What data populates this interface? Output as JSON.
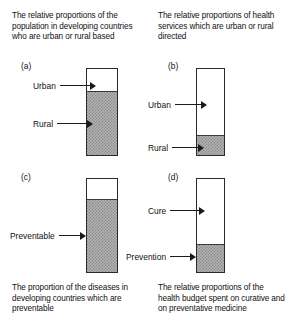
{
  "figure": {
    "panels": [
      {
        "letter": "(a)",
        "caption": "The relative proportions of the population in developing countries who are urban or rural based",
        "caption_position": "above",
        "segments": [
          {
            "label": "Urban",
            "fill": "white",
            "fraction": 0.27
          },
          {
            "label": "Rural",
            "fill": "hatched",
            "fraction": 0.73
          }
        ]
      },
      {
        "letter": "(b)",
        "caption": "The relative proportions of health services which are urban or rural directed",
        "caption_position": "above",
        "segments": [
          {
            "label": "Urban",
            "fill": "white",
            "fraction": 0.78
          },
          {
            "label": "Rural",
            "fill": "hatched",
            "fraction": 0.22
          }
        ]
      },
      {
        "letter": "(c)",
        "caption": "The proportion of the diseases in developing countries which are preventable",
        "caption_position": "below",
        "segments": [
          {
            "label": "",
            "fill": "white",
            "fraction": 0.23
          },
          {
            "label": "Preventable",
            "fill": "hatched",
            "fraction": 0.77
          }
        ]
      },
      {
        "letter": "(d)",
        "caption": "The relative proportions of the health budget spent  on curative and on preventative medicine",
        "caption_position": "below",
        "segments": [
          {
            "label": "Cure",
            "fill": "white",
            "fraction": 0.71
          },
          {
            "label": "Prevention",
            "fill": "hatched",
            "fraction": 0.29
          }
        ]
      }
    ],
    "colors": {
      "outline": "#2a2a2a",
      "hatch_light": "#b3b3b3",
      "hatch_dark": "#8a8a8a",
      "white_fill": "#ffffff",
      "text": "#111111"
    }
  },
  "chart_data": {
    "type": "bar",
    "title": "",
    "charts": [
      {
        "id": "a",
        "title": "The relative proportions of the population in developing countries who are urban or rural based",
        "categories": [
          "Urban",
          "Rural"
        ],
        "values": [
          27,
          73
        ],
        "ylabel": "percent of total",
        "ylim": [
          0,
          100
        ]
      },
      {
        "id": "b",
        "title": "The relative proportions of health services which are urban or rural directed",
        "categories": [
          "Urban",
          "Rural"
        ],
        "values": [
          78,
          22
        ],
        "ylabel": "percent of total",
        "ylim": [
          0,
          100
        ]
      },
      {
        "id": "c",
        "title": "The proportion of the diseases in developing countries which are preventable",
        "categories": [
          "Not preventable",
          "Preventable"
        ],
        "values": [
          23,
          77
        ],
        "ylabel": "percent of total",
        "ylim": [
          0,
          100
        ]
      },
      {
        "id": "d",
        "title": "The relative proportions of the health budget spent  on curative and on preventative medicine",
        "categories": [
          "Cure",
          "Prevention"
        ],
        "values": [
          71,
          29
        ],
        "ylabel": "percent of total",
        "ylim": [
          0,
          100
        ]
      }
    ]
  }
}
